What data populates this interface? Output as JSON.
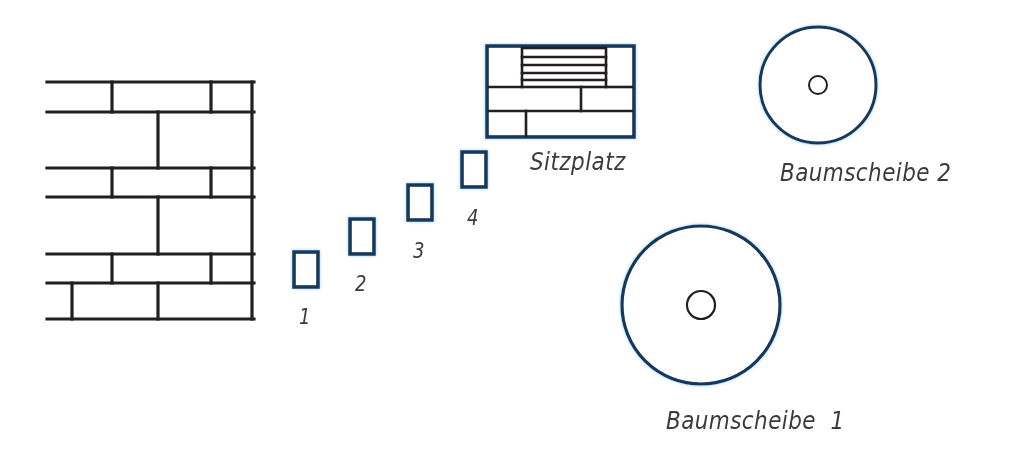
{
  "page": {
    "background_color": "#ffffff",
    "width": 1011,
    "height": 450
  },
  "colors": {
    "brick_stroke": "#231f20",
    "feature_stroke": "#12375c",
    "feature_glow": "#9fd2f0",
    "text": "#3b3b3b",
    "inner_circle_stroke": "#231f20"
  },
  "objects": {
    "brick_wall": {
      "name": "Mauer",
      "x": 47,
      "y": 80,
      "width": 207,
      "height": 240,
      "stroke": "#231f20",
      "rows": 7
    },
    "stepping_stones": [
      {
        "label": "1",
        "x": 294,
        "y": 252,
        "width": 24,
        "height": 35,
        "label_x": 299,
        "label_y": 305
      },
      {
        "label": "2",
        "x": 350,
        "y": 219,
        "width": 24,
        "height": 35,
        "label_x": 355,
        "label_y": 272
      },
      {
        "label": "3",
        "x": 408,
        "y": 185,
        "width": 24,
        "height": 35,
        "label_x": 413,
        "label_y": 238
      },
      {
        "label": "4",
        "x": 462,
        "y": 152,
        "width": 24,
        "height": 35,
        "label_x": 467,
        "label_y": 206
      }
    ],
    "seating_area": {
      "label": "Sitzplatz",
      "x": 487,
      "y": 46,
      "width": 147,
      "height": 91,
      "label_x": 530,
      "label_y": 152
    },
    "tree_discs": [
      {
        "label": "Baumscheibe  1",
        "cx": 701,
        "cy": 305,
        "r": 79,
        "inner_r": 14,
        "label_x": 666,
        "label_y": 408
      },
      {
        "label": "Baumscheibe 2",
        "cx": 818,
        "cy": 85,
        "r": 58,
        "inner_r": 9,
        "label_x": 780,
        "label_y": 160
      }
    ]
  }
}
